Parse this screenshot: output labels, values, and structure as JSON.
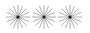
{
  "icons": [
    {
      "name": "starburst-icon",
      "cx": 18,
      "cy": 16
    },
    {
      "name": "starburst-icon",
      "cx": 44,
      "cy": 16
    },
    {
      "name": "starburst-icon",
      "cx": 70,
      "cy": 16
    }
  ],
  "style": {
    "ray_color": "#9a9a9a",
    "center_color": "#222222",
    "rays": 16,
    "radius": 12
  }
}
